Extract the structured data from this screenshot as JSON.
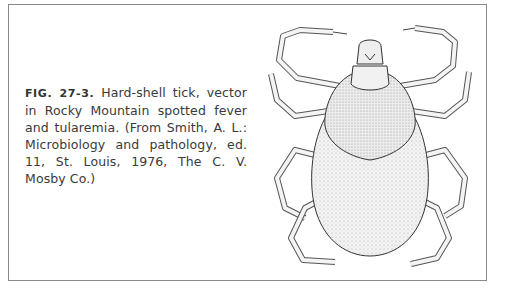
{
  "figure": {
    "label": "FIG. 27-3.",
    "caption": " Hard-shell tick, vector in Rocky Mountain spotted fever and tularemia. (From Smith, A. L.: Microbiology and pathology, ed. 11, St. Louis, 1976, The C. V. Mosby Co.)",
    "illustration": "hard-shell-tick-drawing"
  }
}
